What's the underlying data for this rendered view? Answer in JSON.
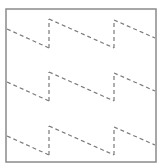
{
  "diagram": {
    "type": "dashed-sawtooth-pattern",
    "frame": {
      "x": 6,
      "y": 9,
      "width": 150,
      "height": 153,
      "stroke": "#8a8a8a"
    },
    "line_color": "#7a7a7a",
    "dash": "4,3",
    "rows": [
      {
        "segments": [
          [
            7,
            29,
            49,
            48
          ],
          [
            49,
            48,
            49,
            19
          ],
          [
            49,
            19,
            114,
            48
          ],
          [
            114,
            48,
            114,
            20
          ],
          [
            114,
            20,
            155,
            38
          ]
        ]
      },
      {
        "segments": [
          [
            7,
            82,
            49,
            101
          ],
          [
            49,
            101,
            49,
            72
          ],
          [
            49,
            72,
            114,
            101
          ],
          [
            114,
            101,
            114,
            73
          ],
          [
            114,
            73,
            155,
            91
          ]
        ]
      },
      {
        "segments": [
          [
            7,
            136,
            49,
            155
          ],
          [
            49,
            155,
            49,
            126
          ],
          [
            49,
            126,
            114,
            155
          ],
          [
            114,
            155,
            114,
            127
          ],
          [
            114,
            127,
            155,
            145
          ]
        ]
      }
    ]
  }
}
